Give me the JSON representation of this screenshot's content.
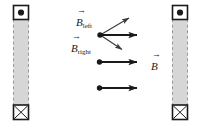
{
  "figure": {
    "background_color": "#ffffff",
    "width": 202,
    "height": 129
  },
  "conductors": [
    {
      "name": "left-conductor",
      "label": "left rod",
      "x": 13,
      "y": 5,
      "width": 16,
      "height": 115,
      "body_color": "#d6d6d6",
      "edge_style": "dashed",
      "edge_color": "#9a9a9a",
      "top_terminal": {
        "symbol": "dot",
        "meaning": "current out of page",
        "box_color": "#ffffff",
        "border_color": "#1a1a1a",
        "mark_color": "#1a1a1a"
      },
      "bottom_terminal": {
        "symbol": "cross",
        "meaning": "current into page",
        "box_color": "#ffffff",
        "border_color": "#1a1a1a",
        "mark_color": "#1a1a1a"
      }
    },
    {
      "name": "right-conductor",
      "label": "right rod",
      "x": 172,
      "y": 5,
      "width": 16,
      "height": 115,
      "body_color": "#d6d6d6",
      "edge_style": "dashed",
      "edge_color": "#9a9a9a",
      "top_terminal": {
        "symbol": "dot",
        "meaning": "current out of page",
        "box_color": "#ffffff",
        "border_color": "#1a1a1a",
        "mark_color": "#1a1a1a"
      },
      "bottom_terminal": {
        "symbol": "cross",
        "meaning": "current into page",
        "box_color": "#ffffff",
        "border_color": "#1a1a1a",
        "mark_color": "#1a1a1a"
      }
    }
  ],
  "vectors": [
    {
      "name": "b-left-vector",
      "symbol": "B",
      "subscript": "left",
      "from": [
        100,
        35
      ],
      "to": [
        131,
        17
      ],
      "color": "#3a3a3a",
      "thin": true
    },
    {
      "name": "b-right-vector",
      "symbol": "B",
      "subscript": "right",
      "from": [
        100,
        35
      ],
      "to": [
        124,
        51
      ],
      "color": "#3a3a3a",
      "thin": true
    },
    {
      "name": "b-resultant-top-vector",
      "symbol": "",
      "subscript": "",
      "from": [
        100,
        35
      ],
      "to": [
        146,
        35
      ],
      "color": "#1a1a1a",
      "thin": false
    },
    {
      "name": "b-resultant-middle-vector",
      "symbol": "B",
      "subscript": "",
      "from": [
        99,
        62
      ],
      "to": [
        146,
        62
      ],
      "color": "#1a1a1a",
      "thin": false
    },
    {
      "name": "b-resultant-bottom-vector",
      "symbol": "",
      "subscript": "",
      "from": [
        99,
        88
      ],
      "to": [
        146,
        88
      ],
      "color": "#1a1a1a",
      "thin": false
    }
  ],
  "labels": {
    "b_left": {
      "symbol": "B",
      "subscript": "left",
      "arrow": "→"
    },
    "b_right": {
      "symbol": "B",
      "subscript": "right",
      "arrow": "→"
    },
    "b_total": {
      "symbol": "B",
      "subscript": "",
      "arrow": "→"
    }
  },
  "field_points": [
    {
      "name": "field-point-top",
      "x": 100,
      "y": 35
    },
    {
      "name": "field-point-middle",
      "x": 99,
      "y": 62
    },
    {
      "name": "field-point-bottom",
      "x": 99,
      "y": 88
    }
  ]
}
